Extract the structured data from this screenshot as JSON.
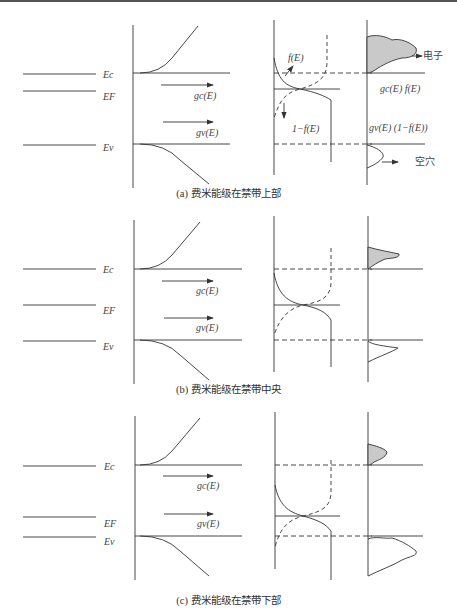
{
  "panels": [
    {
      "id": "a",
      "caption": "(a) 费米能级在禁带上部",
      "labels": {
        "Ec": "Ec",
        "EF": "EF",
        "Ev": "Ev",
        "gc": "gc(E)",
        "gv": "gv(E)",
        "fE": "f(E)",
        "one_minus_f": "1−f(E)",
        "gcf": "gc(E) f(E)",
        "gv1f": "gv(E) (1−f(E))",
        "electron": "电子",
        "hole": "空穴"
      }
    },
    {
      "id": "b",
      "caption": "(b) 费米能级在禁带中央",
      "labels": {
        "Ec": "Ec",
        "EF": "EF",
        "Ev": "Ev",
        "gc": "gc(E)",
        "gv": "gv(E)"
      }
    },
    {
      "id": "c",
      "caption": "(c) 费米能级在禁带下部",
      "labels": {
        "Ec": "Ec",
        "EF": "EF",
        "Ev": "Ev",
        "gc": "gc(E)",
        "gv": "gv(E)"
      }
    }
  ]
}
